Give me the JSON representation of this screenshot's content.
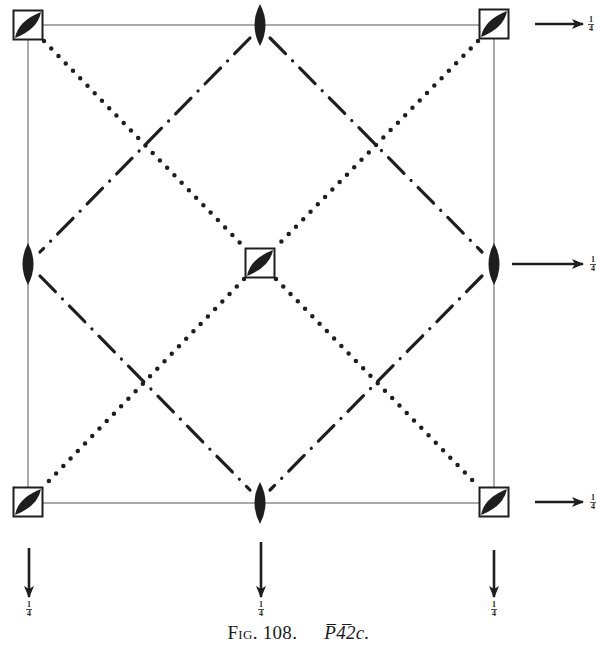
{
  "figure": {
    "caption_label": "Fig. 108.",
    "caption_symbol": "P̅4̅2c.",
    "caption_symbol_parts": {
      "lattice": "P",
      "bar_digit": "4̅",
      "rest": "2c."
    },
    "space_group": "P-42c"
  },
  "diagram": {
    "cell_frame": {
      "x0": 28,
      "y0": 25,
      "x1": 494,
      "y1": 503
    },
    "symbols": {
      "fourbar_axes": [
        {
          "name": "top-left",
          "x": 28,
          "y": 25
        },
        {
          "name": "top-right",
          "x": 494,
          "y": 24
        },
        {
          "name": "center",
          "x": 260,
          "y": 263
        },
        {
          "name": "bottom-left",
          "x": 28,
          "y": 502
        },
        {
          "name": "bottom-right",
          "x": 494,
          "y": 502
        }
      ],
      "twofold_axes": [
        {
          "name": "top-mid",
          "x": 260,
          "y": 25
        },
        {
          "name": "left-mid",
          "x": 28,
          "y": 264
        },
        {
          "name": "right-mid",
          "x": 494,
          "y": 264
        },
        {
          "name": "bottom-mid",
          "x": 260,
          "y": 503
        }
      ]
    },
    "arrows": {
      "horizontal": [
        {
          "y": 24,
          "x_start": 535,
          "x_end": 583,
          "label": "1/4"
        },
        {
          "y": 264,
          "x_start": 512,
          "x_end": 583,
          "label": "1/4"
        },
        {
          "y": 502,
          "x_start": 535,
          "x_end": 583,
          "label": "1/4"
        }
      ],
      "vertical": [
        {
          "x": 29,
          "y_start": 548,
          "y_end": 597,
          "label": "1/4"
        },
        {
          "x": 261,
          "y_start": 542,
          "y_end": 597,
          "label": "1/4"
        },
        {
          "x": 494,
          "y_start": 550,
          "y_end": 597,
          "label": "1/4"
        }
      ]
    },
    "fraction_label": {
      "num": "1",
      "den": "4"
    },
    "colors": {
      "ink": "#1e1e1e",
      "frame": "#555555",
      "background": "#ffffff"
    },
    "line_styles": {
      "dotted": "glide plane c (dotted diagonals)",
      "dash_dot": "glide plane (dash-dot diagonals)"
    }
  }
}
